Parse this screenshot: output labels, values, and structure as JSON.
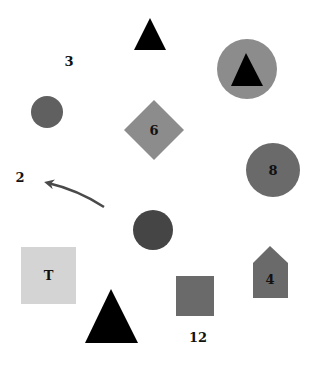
{
  "canvas": {
    "width": 314,
    "height": 367,
    "background": "#ffffff"
  },
  "colors": {
    "black": "#000000",
    "dark_gray": "#454545",
    "mid_gray": "#606060",
    "gray": "#6a6a6a",
    "light_gray": "#8c8c8c",
    "pale_gray": "#d4d4d4",
    "arrow": "#4a4a4a",
    "text": "#111111"
  },
  "labels": {
    "label_3": "3",
    "label_2": "2",
    "label_12": "12",
    "diamond_label": "6",
    "circle_label": "8",
    "square_label": "T",
    "house_label": "4"
  },
  "shapes": [
    {
      "id": "triangle-top",
      "type": "triangle",
      "color": "black",
      "points": "150,18 166,50 134,50"
    },
    {
      "id": "circle-with-triangle",
      "type": "circle",
      "color": "light_gray",
      "cx": 247,
      "cy": 69,
      "r": 30,
      "inner": {
        "type": "triangle",
        "color": "black",
        "points": "246,53 263,86 231,86"
      }
    },
    {
      "id": "circle-small-left",
      "type": "circle",
      "color": "mid_gray",
      "cx": 47,
      "cy": 112,
      "r": 16
    },
    {
      "id": "diamond-6",
      "type": "diamond",
      "color": "light_gray",
      "cx": 154,
      "cy": 130,
      "half": 30,
      "label": "6"
    },
    {
      "id": "circle-8",
      "type": "circle",
      "color": "gray",
      "cx": 273,
      "cy": 170,
      "r": 27,
      "label": "8"
    },
    {
      "id": "arrow",
      "type": "arrow",
      "color": "arrow",
      "from": [
        104,
        207
      ],
      "to": [
        43,
        181
      ]
    },
    {
      "id": "circle-dark",
      "type": "circle",
      "color": "dark_gray",
      "cx": 153,
      "cy": 230,
      "r": 20
    },
    {
      "id": "square-T",
      "type": "square",
      "color": "pale_gray",
      "x": 21,
      "y": 247,
      "w": 55,
      "h": 57,
      "label": "T"
    },
    {
      "id": "house-4",
      "type": "pentagon",
      "color": "gray",
      "points": "270,246 288,263 288,298 253,298 253,263",
      "label": "4"
    },
    {
      "id": "square-gray",
      "type": "square",
      "color": "gray",
      "x": 176,
      "y": 276,
      "w": 38,
      "h": 40
    },
    {
      "id": "triangle-big",
      "type": "triangle",
      "color": "black",
      "points": "111,289 138,343 85,343"
    }
  ],
  "free_text": [
    {
      "id": "text-3",
      "text": "3",
      "x": 69,
      "y": 62
    },
    {
      "id": "text-2",
      "text": "2",
      "x": 20,
      "y": 178
    },
    {
      "id": "text-12",
      "text": "12",
      "x": 198,
      "y": 338
    }
  ]
}
